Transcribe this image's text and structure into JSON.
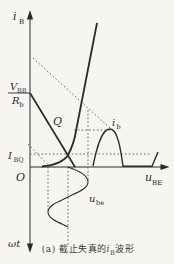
{
  "figure": {
    "type": "transistor-input-characteristic-cutoff-distortion-diagram",
    "colors": {
      "background": "#f6f5f1",
      "line": "#2b2b2b",
      "dotted": "#5a5a5a"
    },
    "axes": {
      "y_label_main": "i",
      "y_label_sub": "B",
      "x_label_main": "u",
      "x_label_sub": "BE",
      "time_axis_label": "ωt",
      "origin_label": "O"
    },
    "labels": {
      "q_point": "Q",
      "ibq_main": "I",
      "ibq_sub": "BQ",
      "vbb_main": "V",
      "vbb_sub": "BB",
      "rb_main": "R",
      "rb_sub": "b",
      "ib_wave_main": "i",
      "ib_wave_sub": "b",
      "ube_wave_main": "u",
      "ube_wave_sub": "be"
    },
    "caption": {
      "prefix": "(a)",
      "text_before": " 截止失真的",
      "symbol_main": "i",
      "symbol_sub": "B",
      "text_after": "波形"
    }
  }
}
